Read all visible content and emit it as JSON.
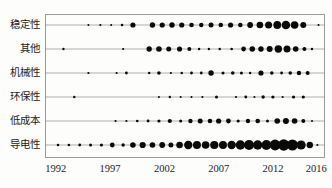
{
  "chart_data": {
    "type": "scatter",
    "title": "",
    "xlabel": "",
    "ylabel": "",
    "legend": "none",
    "grid": "horizontal category lines",
    "bubble_color": "#0a0a0a",
    "xlim": [
      1991.0,
      2016.8
    ],
    "xticks": [
      1992,
      1997,
      2002,
      2007,
      2012,
      2016
    ],
    "xticklabels": [
      "1992",
      "1997",
      "2002",
      "2007",
      "2012",
      "2016"
    ],
    "categories": [
      "稳定性",
      "其他",
      "机械性",
      "环保性",
      "低成本",
      "导电性"
    ],
    "series": [
      {
        "name": "稳定性",
        "points": [
          {
            "x": 1995.0,
            "size": 2.0
          },
          {
            "x": 1996.1,
            "size": 2.2
          },
          {
            "x": 1997.1,
            "size": 2.0
          },
          {
            "x": 1998.1,
            "size": 2.6
          },
          {
            "x": 1999.1,
            "size": 5.2
          },
          {
            "x": 2000.9,
            "size": 5.4
          },
          {
            "x": 2001.8,
            "size": 5.2
          },
          {
            "x": 2002.7,
            "size": 5.4
          },
          {
            "x": 2003.6,
            "size": 5.2
          },
          {
            "x": 2004.5,
            "size": 4.6
          },
          {
            "x": 2005.4,
            "size": 4.4
          },
          {
            "x": 2006.3,
            "size": 5.0
          },
          {
            "x": 2007.2,
            "size": 4.6
          },
          {
            "x": 2008.1,
            "size": 5.2
          },
          {
            "x": 2009.0,
            "size": 4.6
          },
          {
            "x": 2009.9,
            "size": 5.8
          },
          {
            "x": 2010.8,
            "size": 6.6
          },
          {
            "x": 2011.6,
            "size": 7.0
          },
          {
            "x": 2012.4,
            "size": 7.8
          },
          {
            "x": 2013.2,
            "size": 8.6
          },
          {
            "x": 2014.0,
            "size": 7.6
          },
          {
            "x": 2014.8,
            "size": 6.0
          },
          {
            "x": 2016.2,
            "size": 2.0
          }
        ]
      },
      {
        "name": "其他",
        "points": [
          {
            "x": 1992.7,
            "size": 2.4
          },
          {
            "x": 1998.2,
            "size": 2.2
          },
          {
            "x": 2000.6,
            "size": 5.4
          },
          {
            "x": 2001.5,
            "size": 5.6
          },
          {
            "x": 2002.4,
            "size": 5.0
          },
          {
            "x": 2003.4,
            "size": 5.2
          },
          {
            "x": 2004.3,
            "size": 4.0
          },
          {
            "x": 2005.2,
            "size": 2.4
          },
          {
            "x": 2006.1,
            "size": 2.4
          },
          {
            "x": 2007.1,
            "size": 2.4
          },
          {
            "x": 2008.2,
            "size": 2.6
          },
          {
            "x": 2009.3,
            "size": 4.8
          },
          {
            "x": 2010.1,
            "size": 5.6
          },
          {
            "x": 2010.9,
            "size": 5.4
          },
          {
            "x": 2011.7,
            "size": 6.0
          },
          {
            "x": 2012.5,
            "size": 7.4
          },
          {
            "x": 2013.3,
            "size": 7.0
          },
          {
            "x": 2014.1,
            "size": 5.6
          },
          {
            "x": 2014.9,
            "size": 4.0
          },
          {
            "x": 2015.6,
            "size": 2.4
          }
        ]
      },
      {
        "name": "机械性",
        "points": [
          {
            "x": 1995.0,
            "size": 2.2
          },
          {
            "x": 1997.6,
            "size": 2.2
          },
          {
            "x": 1998.5,
            "size": 2.8
          },
          {
            "x": 2000.6,
            "size": 2.4
          },
          {
            "x": 2001.5,
            "size": 3.6
          },
          {
            "x": 2002.6,
            "size": 2.2
          },
          {
            "x": 2003.6,
            "size": 2.4
          },
          {
            "x": 2004.5,
            "size": 2.8
          },
          {
            "x": 2005.4,
            "size": 2.8
          },
          {
            "x": 2006.3,
            "size": 5.4
          },
          {
            "x": 2007.4,
            "size": 3.0
          },
          {
            "x": 2008.3,
            "size": 3.6
          },
          {
            "x": 2009.1,
            "size": 3.0
          },
          {
            "x": 2009.9,
            "size": 2.4
          },
          {
            "x": 2010.9,
            "size": 5.2
          },
          {
            "x": 2011.9,
            "size": 3.4
          },
          {
            "x": 2012.8,
            "size": 2.8
          },
          {
            "x": 2013.6,
            "size": 3.6
          },
          {
            "x": 2014.4,
            "size": 4.4
          },
          {
            "x": 2015.2,
            "size": 4.0
          }
        ]
      },
      {
        "name": "环保性",
        "points": [
          {
            "x": 1993.7,
            "size": 2.4
          },
          {
            "x": 2001.5,
            "size": 2.0
          },
          {
            "x": 2002.5,
            "size": 2.4
          },
          {
            "x": 2003.5,
            "size": 2.0
          },
          {
            "x": 2004.5,
            "size": 2.0
          },
          {
            "x": 2005.5,
            "size": 2.2
          },
          {
            "x": 2006.8,
            "size": 3.0
          },
          {
            "x": 2008.6,
            "size": 2.2
          },
          {
            "x": 2009.5,
            "size": 2.8
          },
          {
            "x": 2010.3,
            "size": 2.0
          },
          {
            "x": 2011.1,
            "size": 3.4
          },
          {
            "x": 2012.0,
            "size": 3.2
          },
          {
            "x": 2012.9,
            "size": 2.2
          },
          {
            "x": 2013.9,
            "size": 3.2
          },
          {
            "x": 2014.8,
            "size": 3.2
          }
        ]
      },
      {
        "name": "低成本",
        "points": [
          {
            "x": 1997.5,
            "size": 2.2
          },
          {
            "x": 1998.5,
            "size": 2.2
          },
          {
            "x": 1999.5,
            "size": 2.6
          },
          {
            "x": 2000.5,
            "size": 2.8
          },
          {
            "x": 2001.5,
            "size": 3.2
          },
          {
            "x": 2002.5,
            "size": 4.2
          },
          {
            "x": 2003.5,
            "size": 3.0
          },
          {
            "x": 2004.4,
            "size": 4.4
          },
          {
            "x": 2005.3,
            "size": 5.0
          },
          {
            "x": 2006.2,
            "size": 4.6
          },
          {
            "x": 2007.0,
            "size": 5.2
          },
          {
            "x": 2007.9,
            "size": 4.8
          },
          {
            "x": 2008.8,
            "size": 3.2
          },
          {
            "x": 2009.7,
            "size": 4.4
          },
          {
            "x": 2010.6,
            "size": 4.6
          },
          {
            "x": 2011.5,
            "size": 3.0
          },
          {
            "x": 2012.4,
            "size": 5.6
          },
          {
            "x": 2013.2,
            "size": 6.0
          },
          {
            "x": 2014.0,
            "size": 5.6
          },
          {
            "x": 2014.8,
            "size": 4.0
          },
          {
            "x": 2015.6,
            "size": 2.0
          }
        ]
      },
      {
        "name": "导电性",
        "points": [
          {
            "x": 1992.2,
            "size": 2.6
          },
          {
            "x": 1993.2,
            "size": 2.6
          },
          {
            "x": 1994.2,
            "size": 2.8
          },
          {
            "x": 1995.2,
            "size": 3.0
          },
          {
            "x": 1996.2,
            "size": 3.2
          },
          {
            "x": 1997.2,
            "size": 4.8
          },
          {
            "x": 1998.2,
            "size": 3.4
          },
          {
            "x": 1999.1,
            "size": 5.6
          },
          {
            "x": 2000.0,
            "size": 6.2
          },
          {
            "x": 2000.9,
            "size": 5.6
          },
          {
            "x": 2001.8,
            "size": 5.8
          },
          {
            "x": 2002.6,
            "size": 5.0
          },
          {
            "x": 2003.4,
            "size": 6.6
          },
          {
            "x": 2004.2,
            "size": 8.4
          },
          {
            "x": 2005.0,
            "size": 8.0
          },
          {
            "x": 2005.8,
            "size": 7.6
          },
          {
            "x": 2006.6,
            "size": 8.2
          },
          {
            "x": 2007.4,
            "size": 8.0
          },
          {
            "x": 2008.2,
            "size": 8.4
          },
          {
            "x": 2009.0,
            "size": 9.4
          },
          {
            "x": 2009.8,
            "size": 10.0
          },
          {
            "x": 2010.6,
            "size": 9.4
          },
          {
            "x": 2011.4,
            "size": 9.8
          },
          {
            "x": 2012.2,
            "size": 10.8
          },
          {
            "x": 2013.0,
            "size": 11.4
          },
          {
            "x": 2013.8,
            "size": 11.0
          },
          {
            "x": 2014.6,
            "size": 9.2
          },
          {
            "x": 2015.4,
            "size": 6.4
          },
          {
            "x": 2016.1,
            "size": 2.0
          }
        ]
      }
    ]
  },
  "axes": {
    "plot_left": 45,
    "plot_top": 14,
    "plot_width": 280,
    "plot_height": 144
  }
}
